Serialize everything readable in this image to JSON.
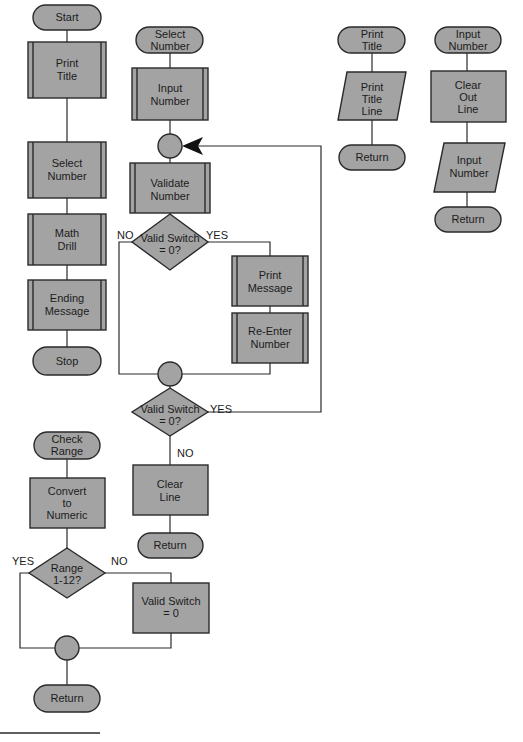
{
  "colors": {
    "fill": "#a3a3a3",
    "stroke": "#2a2a2a",
    "background": "#ffffff"
  },
  "main_program": {
    "start": "Start",
    "print_title": [
      "Print",
      "Title"
    ],
    "select_number": [
      "Select",
      "Number"
    ],
    "math_drill": [
      "Math",
      "Drill"
    ],
    "ending_message": [
      "Ending",
      "Message"
    ],
    "stop": "Stop"
  },
  "select_number_module": {
    "entry": [
      "Select",
      "Number"
    ],
    "input_number": [
      "Input",
      "Number"
    ],
    "validate_number": [
      "Validate",
      "Number"
    ],
    "decision1": {
      "text": [
        "Valid Switch",
        "= 0?"
      ],
      "no": "NO",
      "yes": "YES"
    },
    "print_message": [
      "Print",
      "Message"
    ],
    "reenter_number": [
      "Re-Enter",
      "Number"
    ],
    "decision2": {
      "text": [
        "Valid Switch",
        "= 0?"
      ],
      "yes": "YES",
      "no": "NO"
    },
    "clear_line": [
      "Clear",
      "Line"
    ],
    "return": "Return"
  },
  "print_title_module": {
    "entry": [
      "Print",
      "Title"
    ],
    "print_title_line": [
      "Print",
      "Title",
      "Line"
    ],
    "return": "Return"
  },
  "input_number_module": {
    "entry": [
      "Input",
      "Number"
    ],
    "clear_out_line": [
      "Clear",
      "Out",
      "Line"
    ],
    "input_number": [
      "Input",
      "Number"
    ],
    "return": "Return"
  },
  "check_range_module": {
    "entry": [
      "Check",
      "Range"
    ],
    "convert": [
      "Convert",
      "to",
      "Numeric"
    ],
    "decision": {
      "text": [
        "Range",
        "1-12?"
      ],
      "yes": "YES",
      "no": "NO"
    },
    "valid_switch": [
      "Valid Switch",
      "= 0"
    ],
    "return": "Return"
  }
}
